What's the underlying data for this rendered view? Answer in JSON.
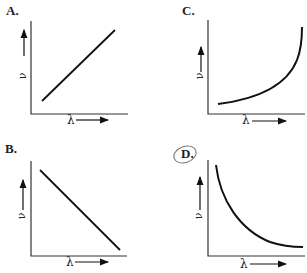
{
  "panels": [
    {
      "id": "A",
      "label": "A.",
      "curve": "linear-increasing",
      "ylabel": "ν",
      "xlabel": "λ"
    },
    {
      "id": "C",
      "label": "C.",
      "curve": "exponential-increasing",
      "ylabel": "ν",
      "xlabel": "λ"
    },
    {
      "id": "B",
      "label": "B.",
      "curve": "linear-decreasing",
      "ylabel": "ν",
      "xlabel": "λ"
    },
    {
      "id": "D",
      "label": "D.",
      "curve": "inverse-decreasing",
      "ylabel": "ν",
      "xlabel": "λ",
      "circled": true
    }
  ],
  "colors": {
    "line": "#111111",
    "axis": "#333333",
    "text": "#222222"
  }
}
